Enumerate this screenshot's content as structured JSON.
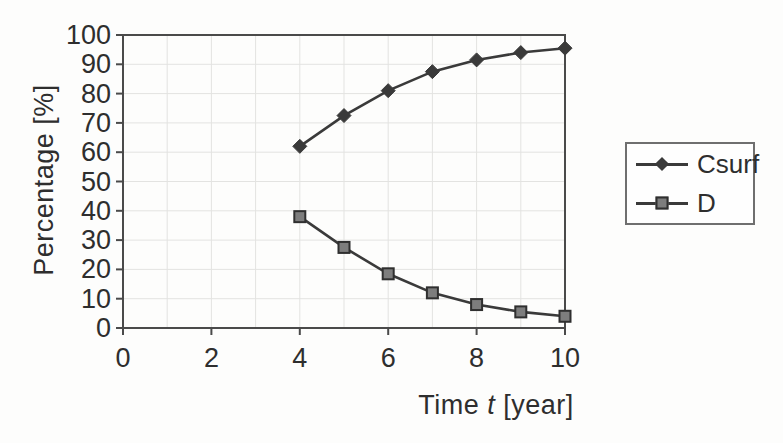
{
  "chart_data": {
    "type": "line",
    "x": [
      4,
      5,
      6,
      7,
      8,
      9,
      10
    ],
    "series": [
      {
        "name": "Csurf",
        "marker": "diamond",
        "values": [
          62,
          72.5,
          81,
          87.5,
          91.5,
          94,
          95.5
        ]
      },
      {
        "name": "D",
        "marker": "square",
        "values": [
          38,
          27.5,
          18.5,
          12,
          8,
          5.5,
          4
        ]
      }
    ],
    "title": "",
    "xlabel": "Time t [year]",
    "xlabel_parts": {
      "prefix": "Time ",
      "italic": "t",
      "suffix": " [year]"
    },
    "ylabel": "Percentage [%]",
    "xlim": [
      0,
      10
    ],
    "ylim": [
      0,
      100
    ],
    "x_ticks": [
      0,
      2,
      4,
      6,
      8,
      10
    ],
    "y_ticks": [
      0,
      10,
      20,
      30,
      40,
      50,
      60,
      70,
      80,
      90,
      100
    ],
    "x_grid_interval": 1,
    "y_grid_interval": 10,
    "grid": true,
    "legend_position": "right"
  },
  "colors": {
    "line": "#3a3a3a",
    "diamond_fill": "#3a3a3a",
    "square_fill": "#7d7d7d",
    "square_border": "#2f2f2f",
    "grid": "#e3e3e1",
    "axis": "#4a4a4a",
    "text": "#2e2e2e",
    "background": "#fdfdfc",
    "legend_border": "#6f6f6f"
  }
}
